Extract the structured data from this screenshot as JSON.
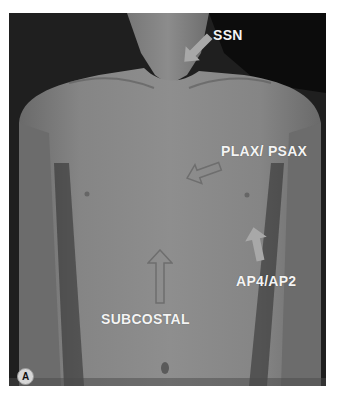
{
  "figure": {
    "panel_label": "A",
    "annotations": [
      {
        "id": "ssn",
        "label": "SSN",
        "arrow_style": "filled-light",
        "arrow_direction": "down-left"
      },
      {
        "id": "plax-psax",
        "label": "PLAX/ PSAX",
        "arrow_style": "outlined",
        "arrow_direction": "left"
      },
      {
        "id": "ap4-ap2",
        "label": "AP4/AP2",
        "arrow_style": "filled-light",
        "arrow_direction": "up"
      },
      {
        "id": "subcostal",
        "label": "SUBCOSTAL",
        "arrow_style": "outlined",
        "arrow_direction": "up"
      }
    ],
    "colors": {
      "background": "#1e1e1e",
      "skin": "#8a8a8a",
      "label_text": "#f4f4f4",
      "arrow_fill": "#a8a8a8",
      "arrow_outline": "#6e6e6e"
    }
  }
}
